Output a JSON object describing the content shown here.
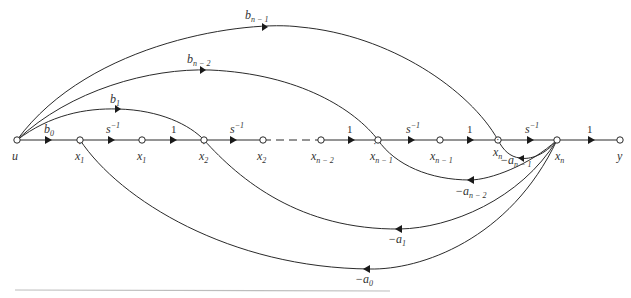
{
  "diagram": {
    "type": "signal-flow-graph",
    "colors": {
      "line": "#2a2a2a",
      "background": "#ffffff",
      "rule": "#bdbdbd"
    },
    "nodes": [
      {
        "id": "u",
        "x": 17,
        "y": 140,
        "label": "u",
        "sub": "",
        "dot": false
      },
      {
        "id": "xd1",
        "x": 80,
        "y": 140,
        "label": "x",
        "sub": "1",
        "dot": true
      },
      {
        "id": "x1",
        "x": 142,
        "y": 140,
        "label": "x",
        "sub": "1",
        "dot": false
      },
      {
        "id": "xd2",
        "x": 204,
        "y": 140,
        "label": "x",
        "sub": "2",
        "dot": true
      },
      {
        "id": "x2",
        "x": 263,
        "y": 140,
        "label": "x",
        "sub": "2",
        "dot": false
      },
      {
        "id": "xn2",
        "x": 321,
        "y": 140,
        "label": "x",
        "sub": "n − 2",
        "dot": false
      },
      {
        "id": "xdn1",
        "x": 378,
        "y": 140,
        "label": "x",
        "sub": "n − 1",
        "dot": true
      },
      {
        "id": "xn1",
        "x": 440,
        "y": 140,
        "label": "x",
        "sub": "n − 1",
        "dot": false
      },
      {
        "id": "xdn",
        "x": 498,
        "y": 140,
        "label": "x",
        "sub": "n",
        "dot": true
      },
      {
        "id": "xn",
        "x": 557,
        "y": 140,
        "label": "x",
        "sub": "n",
        "dot": false
      },
      {
        "id": "y",
        "x": 620,
        "y": 140,
        "label": "y",
        "sub": "",
        "dot": false
      }
    ],
    "forward_gains": [
      {
        "from": "u",
        "to": "xd1",
        "label": "b",
        "sub": "0",
        "sup": ""
      },
      {
        "from": "xd1",
        "to": "x1",
        "label": "s",
        "sub": "",
        "sup": "−1"
      },
      {
        "from": "x1",
        "to": "xd2",
        "label": "1",
        "sub": "",
        "sup": ""
      },
      {
        "from": "xd2",
        "to": "x2",
        "label": "s",
        "sub": "",
        "sup": "−1"
      },
      {
        "from": "xn2",
        "to": "xdn1",
        "label": "1",
        "sub": "",
        "sup": ""
      },
      {
        "from": "xdn1",
        "to": "xn1",
        "label": "s",
        "sub": "",
        "sup": "−1"
      },
      {
        "from": "xn1",
        "to": "xdn",
        "label": "1",
        "sub": "",
        "sup": ""
      },
      {
        "from": "xdn",
        "to": "xn",
        "label": "s",
        "sub": "",
        "sup": "−1"
      },
      {
        "from": "xn",
        "to": "y",
        "label": "1",
        "sub": "",
        "sup": ""
      }
    ],
    "feedforward_gains": [
      {
        "from": "u",
        "to": "xd2",
        "label": "b",
        "sub": "1"
      },
      {
        "from": "u",
        "to": "xdn1",
        "label": "b",
        "sub": "n − 2"
      },
      {
        "from": "u",
        "to": "xdn",
        "label": "b",
        "sub": "n − 1"
      }
    ],
    "feedback_gains": [
      {
        "from": "xn",
        "to": "xdn",
        "label": "−a",
        "sub": "n − 1"
      },
      {
        "from": "xn",
        "to": "xdn1",
        "label": "−a",
        "sub": "n − 2"
      },
      {
        "from": "xn",
        "to": "xd2",
        "label": "−a",
        "sub": "1"
      },
      {
        "from": "xn",
        "to": "xd1",
        "label": "−a",
        "sub": "0"
      }
    ]
  }
}
